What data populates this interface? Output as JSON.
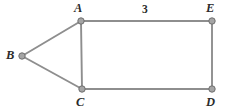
{
  "figure": {
    "background_color": "#ffffff",
    "edge_color": "#8e8e8e",
    "vertex_fill_color": "#a5a5a5",
    "vertex_stroke_color": "#6f6f6f",
    "label_color": "#2b2b2b",
    "width": 226,
    "height": 111
  },
  "chart_data": {
    "type": "diagram",
    "diagram_kind": "graph",
    "directed": false,
    "title": "",
    "nodes": [
      {
        "id": "A",
        "label": "A",
        "x": 81,
        "y": 21,
        "label_x": 74,
        "label_y": 2
      },
      {
        "id": "B",
        "label": "B",
        "x": 22,
        "y": 56,
        "label_x": 6,
        "label_y": 49
      },
      {
        "id": "C",
        "label": "C",
        "x": 82,
        "y": 89,
        "label_x": 76,
        "label_y": 96
      },
      {
        "id": "D",
        "label": "D",
        "x": 212,
        "y": 89,
        "label_x": 206,
        "label_y": 96
      },
      {
        "id": "E",
        "label": "E",
        "x": 212,
        "y": 21,
        "label_x": 206,
        "label_y": 2
      }
    ],
    "edges": [
      {
        "id": "B-A",
        "from": "B",
        "to": "A",
        "label": ""
      },
      {
        "id": "B-C",
        "from": "B",
        "to": "C",
        "label": ""
      },
      {
        "id": "A-C",
        "from": "A",
        "to": "C",
        "label": ""
      },
      {
        "id": "A-E",
        "from": "A",
        "to": "E",
        "label": "3",
        "label_x": 142,
        "label_y": 4
      },
      {
        "id": "E-D",
        "from": "E",
        "to": "D",
        "label": ""
      },
      {
        "id": "C-D",
        "from": "C",
        "to": "D",
        "label": ""
      }
    ],
    "edge_labels": [
      {
        "edge": "A-E",
        "value": "3"
      }
    ]
  }
}
